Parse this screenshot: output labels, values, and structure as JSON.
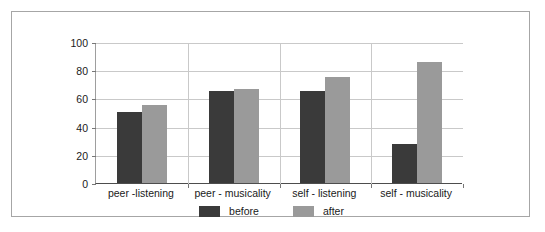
{
  "chart_data": {
    "type": "bar",
    "title": "",
    "subtitle": "",
    "xlabel": "",
    "ylabel": "",
    "ylim": [
      0,
      100
    ],
    "yticks": [
      0,
      20,
      40,
      60,
      80,
      100
    ],
    "grid": true,
    "legend_position": "bottom-center",
    "categories": [
      "peer -listening",
      "peer - musicality",
      "self - listening",
      "self - musicality"
    ],
    "series": [
      {
        "name": "before",
        "color": "#3a3a3a",
        "values": [
          50,
          65,
          65,
          28
        ]
      },
      {
        "name": "after",
        "color": "#9a9a9a",
        "values": [
          55,
          67,
          75,
          86
        ]
      }
    ]
  },
  "axis": {
    "y_tick_labels": [
      "0",
      "20",
      "40",
      "60",
      "80",
      "100"
    ]
  },
  "legend": {
    "entries": [
      {
        "label": "before"
      },
      {
        "label": "after"
      }
    ]
  },
  "colors": {
    "before": "#3a3a3a",
    "after": "#9a9a9a",
    "frame": "#a6a6a6",
    "gridline": "#c9c9c9",
    "axis": "#4d4d4d",
    "background": "#ffffff",
    "text": "#1a1a1a"
  }
}
